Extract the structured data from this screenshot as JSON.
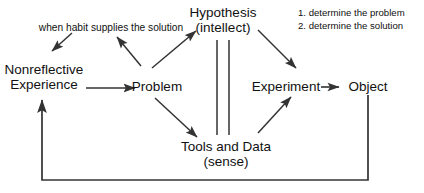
{
  "diagram": {
    "background_color": "#ffffff",
    "line_color": "#333333",
    "text_color": "#111111",
    "nodes": {
      "nonreflective_experience": {
        "line1": "Nonreflective",
        "line2": "Experience"
      },
      "problem": {
        "line1": "Problem"
      },
      "hypothesis": {
        "line1": "Hypothesis",
        "line2": "(intellect)"
      },
      "tools_and_data": {
        "line1": "Tools and Data",
        "line2": "(sense)"
      },
      "experiment": {
        "line1": "Experiment"
      },
      "object": {
        "line1": "Object"
      }
    },
    "annotations": {
      "habit_label": "when habit supplies the solution",
      "steps": {
        "item1": "1. determine the problem",
        "item2": "2. determine the solution"
      }
    },
    "edges": [
      {
        "name": "habit-label-to-nonreflective-experience",
        "from": "when habit supplies the solution",
        "to": "Nonreflective Experience",
        "style": "arrow"
      },
      {
        "name": "problem-to-habit-label",
        "from": "Problem",
        "to": "when habit supplies the solution",
        "style": "arrow"
      },
      {
        "name": "nonreflective-experience-to-problem",
        "from": "Nonreflective Experience",
        "to": "Problem",
        "style": "arrow"
      },
      {
        "name": "problem-to-hypothesis",
        "from": "Problem",
        "to": "Hypothesis (intellect)",
        "style": "arrow"
      },
      {
        "name": "problem-to-tools-and-data",
        "from": "Problem",
        "to": "Tools and Data (sense)",
        "style": "arrow"
      },
      {
        "name": "hypothesis-to-experiment",
        "from": "Hypothesis (intellect)",
        "to": "Experiment",
        "style": "arrow"
      },
      {
        "name": "tools-and-data-to-experiment",
        "from": "Tools and Data (sense)",
        "to": "Experiment",
        "style": "arrow"
      },
      {
        "name": "experiment-to-object",
        "from": "Experiment",
        "to": "Object",
        "style": "arrow"
      },
      {
        "name": "hypothesis-tools-double-link",
        "from": "Hypothesis (intellect)",
        "to": "Tools and Data (sense)",
        "style": "double-line"
      },
      {
        "name": "object-to-nonreflective-experience-feedback",
        "from": "Object",
        "to": "Nonreflective Experience",
        "style": "elbow-arrow"
      }
    ]
  }
}
